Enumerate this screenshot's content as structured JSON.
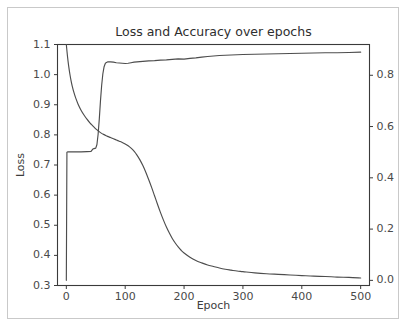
{
  "figure": {
    "title": "Loss and Accuracy over epochs",
    "background_color": "#ffffff",
    "border_color": "#c9c9c9",
    "line_color": "#4d4d4d",
    "axis_color": "#3a3a3a",
    "text_color": "#4a4a4a"
  },
  "chart_data": {
    "type": "line",
    "title": "Loss and Accuracy over epochs",
    "xlabel": "Epoch",
    "ylabel": "Loss",
    "y2label": "",
    "grid": false,
    "legend": false,
    "legend_position": "none",
    "xlim": [
      -15,
      515
    ],
    "ylim": [
      0.3,
      1.1
    ],
    "y2lim": [
      -0.02,
      0.92
    ],
    "xticks": [
      0,
      100,
      200,
      300,
      400,
      500
    ],
    "xticklabels": [
      "0",
      "100",
      "200",
      "300",
      "400",
      "500"
    ],
    "yticks": [
      0.3,
      0.4,
      0.5,
      0.6,
      0.7,
      0.8,
      0.9,
      1.0,
      1.1
    ],
    "yticklabels": [
      "0.3",
      "0.4",
      "0.5",
      "0.6",
      "0.7",
      "0.8",
      "0.9",
      "1.0",
      "1.1"
    ],
    "y2ticks": [
      0.0,
      0.2,
      0.4,
      0.6,
      0.8
    ],
    "y2ticklabels": [
      "0.0",
      "0.2",
      "0.4",
      "0.6",
      "0.8"
    ],
    "series": [
      {
        "name": "Loss",
        "axis": "left",
        "color": "#4d4d4d",
        "x": [
          0,
          2,
          4,
          6,
          8,
          10,
          13,
          16,
          20,
          25,
          30,
          35,
          40,
          45,
          50,
          55,
          60,
          65,
          70,
          75,
          80,
          85,
          90,
          95,
          100,
          105,
          110,
          115,
          120,
          125,
          130,
          135,
          140,
          145,
          150,
          155,
          160,
          165,
          170,
          175,
          180,
          185,
          190,
          195,
          200,
          210,
          220,
          230,
          240,
          250,
          260,
          270,
          280,
          290,
          300,
          320,
          340,
          360,
          380,
          400,
          420,
          440,
          460,
          480,
          500
        ],
        "y": [
          1.1,
          1.06,
          1.028,
          1.002,
          0.98,
          0.962,
          0.94,
          0.922,
          0.902,
          0.882,
          0.866,
          0.852,
          0.84,
          0.83,
          0.82,
          0.812,
          0.805,
          0.8,
          0.795,
          0.791,
          0.787,
          0.783,
          0.779,
          0.775,
          0.77,
          0.764,
          0.756,
          0.746,
          0.733,
          0.717,
          0.698,
          0.676,
          0.651,
          0.625,
          0.597,
          0.569,
          0.542,
          0.517,
          0.494,
          0.474,
          0.456,
          0.441,
          0.428,
          0.417,
          0.408,
          0.394,
          0.383,
          0.375,
          0.368,
          0.363,
          0.358,
          0.354,
          0.351,
          0.348,
          0.346,
          0.342,
          0.339,
          0.337,
          0.335,
          0.333,
          0.331,
          0.33,
          0.328,
          0.327,
          0.325
        ]
      },
      {
        "name": "Accuracy",
        "axis": "right",
        "color": "#4d4d4d",
        "x": [
          0,
          1,
          2,
          4,
          8,
          15,
          25,
          35,
          42,
          45,
          47,
          50,
          52,
          54,
          56,
          58,
          60,
          62,
          64,
          66,
          68,
          70,
          75,
          80,
          85,
          90,
          95,
          100,
          105,
          110,
          115,
          120,
          130,
          140,
          150,
          160,
          170,
          180,
          190,
          200,
          210,
          220,
          230,
          240,
          250,
          260,
          270,
          280,
          300,
          320,
          340,
          360,
          380,
          400,
          420,
          440,
          460,
          480,
          500
        ],
        "y": [
          0.0,
          0.5,
          0.501,
          0.501,
          0.501,
          0.501,
          0.501,
          0.502,
          0.503,
          0.512,
          0.514,
          0.516,
          0.53,
          0.57,
          0.63,
          0.7,
          0.76,
          0.805,
          0.832,
          0.845,
          0.85,
          0.852,
          0.852,
          0.851,
          0.849,
          0.848,
          0.847,
          0.846,
          0.847,
          0.849,
          0.851,
          0.852,
          0.854,
          0.856,
          0.857,
          0.859,
          0.86,
          0.862,
          0.864,
          0.863,
          0.866,
          0.868,
          0.871,
          0.873,
          0.875,
          0.877,
          0.878,
          0.879,
          0.881,
          0.882,
          0.883,
          0.884,
          0.885,
          0.886,
          0.887,
          0.888,
          0.888,
          0.889,
          0.89
        ]
      }
    ]
  }
}
